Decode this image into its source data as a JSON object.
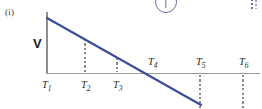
{
  "figure": {
    "part_label": "(i)",
    "y_axis_label": "V",
    "line_color": "#3d4b9b",
    "axis_color": "#9a9a9a",
    "guide_color": "#8a8a8a",
    "artifact_color": "#4a5494"
  },
  "ticks": [
    {
      "label": "T",
      "sub": "1",
      "x": 46,
      "position": "below",
      "guide": "none"
    },
    {
      "label": "T",
      "sub": "2",
      "x": 85,
      "position": "below",
      "guide": "up"
    },
    {
      "label": "T",
      "sub": "3",
      "x": 117,
      "position": "below",
      "guide": "up"
    },
    {
      "label": "T",
      "sub": "4",
      "x": 152,
      "position": "above",
      "guide": "none"
    },
    {
      "label": "T",
      "sub": "5",
      "x": 200,
      "position": "above",
      "guide": "down"
    },
    {
      "label": "T",
      "sub": "6",
      "x": 243,
      "position": "above",
      "guide": "down"
    }
  ],
  "chart_data": {
    "type": "line",
    "title": "",
    "xlabel": "",
    "ylabel": "V",
    "categories": [
      "T1",
      "T2",
      "T3",
      "T4",
      "T5",
      "T6"
    ],
    "x": [
      46,
      85,
      117,
      152,
      200,
      243
    ],
    "series": [
      {
        "name": "velocity",
        "comment": "velocity decreases linearly, crossing zero at T4 and continuing negative; drawn segment stops near T5",
        "x_px": [
          47,
          201
        ],
        "y_px": [
          18,
          105
        ],
        "values_normalized": [
          1.0,
          0.49,
          0.07,
          -0.39,
          -1.02,
          null
        ],
        "zero_crossing": "T4"
      }
    ],
    "ylim": [
      -1.1,
      1.1
    ],
    "grid": false,
    "legend": "none",
    "annotations": [
      "(i)"
    ]
  }
}
